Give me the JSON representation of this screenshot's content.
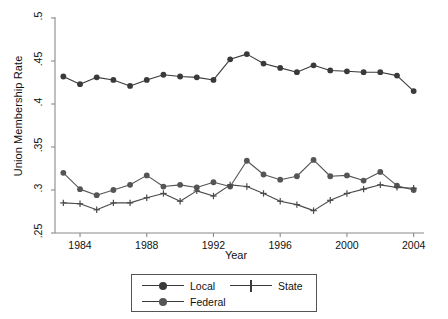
{
  "chart_data": {
    "type": "line",
    "title": "",
    "xlabel": "Year",
    "ylabel": "Union Membership Rate",
    "xlim": [
      1982.5,
      2004.5
    ],
    "ylim": [
      0.25,
      0.5
    ],
    "grid": false,
    "legend_position": "bottom-center",
    "x": [
      1983,
      1984,
      1985,
      1986,
      1987,
      1988,
      1989,
      1990,
      1991,
      1992,
      1993,
      1994,
      1995,
      1996,
      1997,
      1998,
      1999,
      2000,
      2001,
      2002,
      2003,
      2004
    ],
    "xticks": [
      1984,
      1988,
      1992,
      1996,
      2000,
      2004
    ],
    "xticklabels": [
      "1984",
      "1988",
      "1992",
      "1996",
      "2000",
      "2004"
    ],
    "yticks": [
      0.25,
      0.3,
      0.35,
      0.4,
      0.45,
      0.5
    ],
    "yticklabels": [
      ".25",
      ".3",
      ".35",
      ".4",
      ".45",
      ".5"
    ],
    "series": [
      {
        "name": "Local",
        "marker": "circle-filled",
        "color": "#3a3a3a",
        "values": [
          0.432,
          0.423,
          0.431,
          0.428,
          0.421,
          0.428,
          0.434,
          0.432,
          0.431,
          0.428,
          0.452,
          0.458,
          0.447,
          0.442,
          0.437,
          0.445,
          0.439,
          0.438,
          0.437,
          0.437,
          0.433,
          0.415
        ]
      },
      {
        "name": "Federal",
        "marker": "circle-filled",
        "color": "#555555",
        "values": [
          0.32,
          0.301,
          0.294,
          0.3,
          0.306,
          0.317,
          0.304,
          0.306,
          0.303,
          0.309,
          0.304,
          0.334,
          0.318,
          0.312,
          0.316,
          0.335,
          0.316,
          0.317,
          0.311,
          0.321,
          0.305,
          0.3
        ]
      },
      {
        "name": "State",
        "marker": "plus",
        "color": "#4a4a4a",
        "values": [
          0.285,
          0.284,
          0.277,
          0.285,
          0.285,
          0.291,
          0.296,
          0.287,
          0.299,
          0.293,
          0.306,
          0.304,
          0.296,
          0.287,
          0.283,
          0.276,
          0.288,
          0.296,
          0.301,
          0.306,
          0.303,
          0.302
        ]
      }
    ]
  },
  "axes": {
    "y_title": "Union Membership Rate",
    "x_title": "Year"
  },
  "legend": {
    "entries": [
      {
        "label": "Local",
        "marker": "circle-filled"
      },
      {
        "label": "State",
        "marker": "plus"
      },
      {
        "label": "Federal",
        "marker": "circle-filled"
      }
    ]
  }
}
